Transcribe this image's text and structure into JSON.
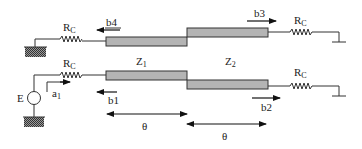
{
  "diagram": {
    "labels": {
      "rc_top_left": "R",
      "rc_top_left_sub": "C",
      "rc_top_right": "R",
      "rc_top_right_sub": "C",
      "rc_bottom_left": "R",
      "rc_bottom_left_sub": "C",
      "rc_bottom_right": "R",
      "rc_bottom_right_sub": "C",
      "z1": "Z",
      "z1_sub": "1",
      "z2": "Z",
      "z2_sub": "2",
      "source": "E",
      "a1": "a",
      "a1_sub": "1",
      "b1": "b1",
      "b2": "b2",
      "b3": "b3",
      "b4": "b4",
      "theta_1": "θ",
      "theta_2": "θ"
    },
    "components": [
      {
        "id": "rc-top-left",
        "type": "resistor"
      },
      {
        "id": "rc-top-right",
        "type": "resistor"
      },
      {
        "id": "rc-bottom-left",
        "type": "resistor"
      },
      {
        "id": "rc-bottom-right",
        "type": "resistor"
      },
      {
        "id": "z1-top",
        "type": "transmission-line",
        "impedance": "Z1"
      },
      {
        "id": "z2-top",
        "type": "transmission-line",
        "impedance": "Z2"
      },
      {
        "id": "z1-bottom",
        "type": "transmission-line",
        "impedance": "Z1"
      },
      {
        "id": "z2-bottom",
        "type": "transmission-line",
        "impedance": "Z2"
      },
      {
        "id": "source-e",
        "type": "voltage-source"
      }
    ],
    "colors": {
      "line_fill": "#b4b4b4",
      "stroke": "#333333",
      "ground_hatch": "#555555"
    }
  }
}
